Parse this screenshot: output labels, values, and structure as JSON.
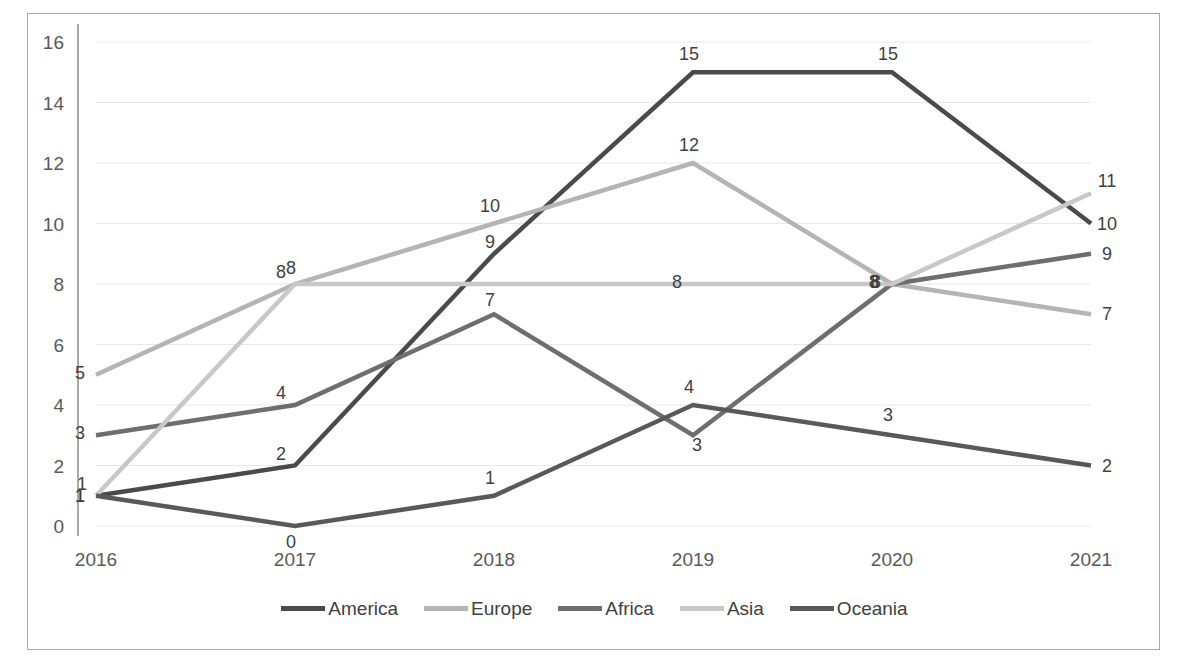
{
  "chart_data": {
    "type": "line",
    "title": "",
    "xlabel": "",
    "ylabel": "",
    "categories": [
      "2016",
      "2017",
      "2018",
      "2019",
      "2020",
      "2021"
    ],
    "ylim": [
      0,
      16
    ],
    "ytick_step": 2,
    "yticks": [
      "0",
      "2",
      "4",
      "6",
      "8",
      "10",
      "12",
      "14",
      "16"
    ],
    "grid": true,
    "grid_axis": "y",
    "legend_position": "bottom",
    "data_labels": true,
    "series": [
      {
        "name": "America",
        "color": "#4a4a4a",
        "values": [
          1,
          2,
          9,
          15,
          15,
          10
        ]
      },
      {
        "name": "Europe",
        "color": "#b4b4b4",
        "values": [
          5,
          8,
          10,
          12,
          8,
          7
        ]
      },
      {
        "name": "Africa",
        "color": "#6e6e6e",
        "values": [
          3,
          4,
          7,
          3,
          8,
          9
        ]
      },
      {
        "name": "Asia",
        "color": "#c8c8c8",
        "values": [
          1,
          8,
          8,
          8,
          8,
          11
        ]
      },
      {
        "name": "Oceania",
        "color": "#595959",
        "values": [
          1,
          0,
          1,
          4,
          3,
          2
        ]
      }
    ]
  },
  "legend": {
    "items": [
      {
        "label": "America",
        "color": "#4a4a4a"
      },
      {
        "label": "Europe",
        "color": "#b4b4b4"
      },
      {
        "label": "Africa",
        "color": "#6e6e6e"
      },
      {
        "label": "Asia",
        "color": "#c8c8c8"
      },
      {
        "label": "Oceania",
        "color": "#595959"
      }
    ]
  }
}
